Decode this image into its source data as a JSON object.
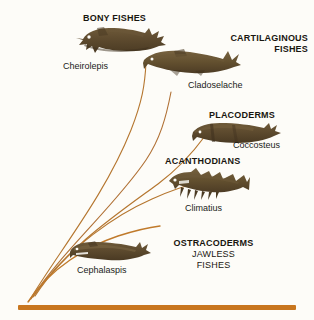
{
  "diagram": {
    "background_color": "#fdfcf8",
    "baseline_color": "#c8761f",
    "branch_color": "#b5762f",
    "fish_color": "#5d4a2e",
    "groups": [
      {
        "id": "bony-fishes",
        "label": "BONY FISHES",
        "genus": "Cheirolepis",
        "label_x": 83,
        "label_y": 13,
        "genus_x": 63,
        "genus_y": 61,
        "fish_x": 73,
        "fish_y": 26,
        "fish_w": 93,
        "fish_h": 28
      },
      {
        "id": "cartilaginous-fishes",
        "label": "CARTILAGINOUS",
        "label_line2": "FISHES",
        "genus": "Cladoselache",
        "label_x": 196,
        "label_y": 33,
        "genus_x": 188,
        "genus_y": 80,
        "fish_x": 140,
        "fish_y": 48,
        "fish_w": 103,
        "fish_h": 28
      },
      {
        "id": "placoderms",
        "label": "PLACODERMS",
        "genus": "Coccosteus",
        "label_x": 209,
        "label_y": 110,
        "genus_x": 233,
        "genus_y": 140,
        "fish_x": 190,
        "fish_y": 122,
        "fish_w": 92,
        "fish_h": 23
      },
      {
        "id": "acanthodians",
        "label": "ACANTHODIANS",
        "genus": "Climatius",
        "label_x": 165,
        "label_y": 156,
        "genus_x": 185,
        "genus_y": 203,
        "fish_x": 163,
        "fish_y": 168,
        "fish_w": 87,
        "fish_h": 32
      },
      {
        "id": "ostracoderms",
        "label": "OSTRACODERMS",
        "label_line2": "JAWLESS",
        "label_line3": "FISHES",
        "genus": "Cephalaspis",
        "label_x": 161,
        "label_y": 238,
        "genus_x": 77,
        "genus_y": 265,
        "fish_x": 68,
        "fish_y": 240,
        "fish_w": 83,
        "fish_h": 23
      }
    ]
  }
}
